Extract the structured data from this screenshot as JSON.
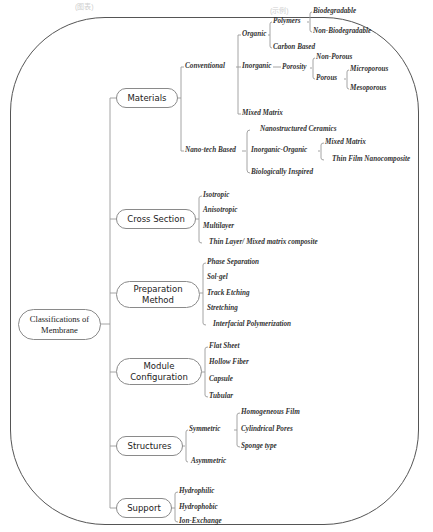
{
  "header_faint": [
    "(图表)",
    "(示例)"
  ],
  "root": {
    "label": "Classifications of Membrane",
    "line1": "Classifications of",
    "line2": "Membrane"
  },
  "categories": {
    "materials": {
      "label": "Materials",
      "conventional": {
        "label": "Conventional",
        "organic": {
          "label": "Organic",
          "polymers": {
            "label": "Polymers",
            "children": [
              "Biodegradable",
              "Non-Biodegradable"
            ]
          },
          "carbon_based": "Carbon Based"
        },
        "inorganic": {
          "label": "Inorganic",
          "porosity": {
            "label": "Porosity",
            "non_porous": "Non-Porous",
            "porous": {
              "label": "Porous",
              "children": [
                "Microporous",
                "Mesoporous"
              ]
            }
          }
        },
        "mixed_matrix": "Mixed Matrix"
      },
      "nanotech": {
        "label": "Nano-tech Based",
        "nanostructured_ceramics": "Nanostructured Ceramics",
        "inorganic_organic": {
          "label": "Inorganic-Organic",
          "children": [
            "Mixed Matrix",
            "Thin Film Nanocomposite"
          ]
        },
        "biologically_inspired": "Biologically Inspired"
      }
    },
    "cross_section": {
      "label": "Cross Section",
      "children": [
        "Isotropic",
        "Anisotropic",
        "Multilayer",
        "Thin Layer/ Mixed matrix composite"
      ]
    },
    "preparation_method": {
      "label": "Preparation Method",
      "line1": "Preparation",
      "line2": "Method",
      "children": [
        "Phase Separation",
        "Sol-gel",
        "Track Etching",
        "Stretching",
        "Interfacial Polymerization"
      ]
    },
    "module_configuration": {
      "label": "Module Configuration",
      "line1": "Module",
      "line2": "Configuration",
      "children": [
        "Flat Sheet",
        "Hollow Fiber",
        "Capsule",
        "Tubular"
      ]
    },
    "structures": {
      "label": "Structures",
      "symmetric": {
        "label": "Symmetric",
        "children": [
          "Homogeneous Film",
          "Cylindrical Pores",
          "Sponge type"
        ]
      },
      "asymmetric": "Asymmetric"
    },
    "support": {
      "label": "Support",
      "children": [
        "Hydrophilic",
        "Hydrophobic",
        "Ion-Exchange"
      ]
    }
  },
  "colors": {
    "line": "#9a9a9a",
    "frame": "#555555",
    "text": "#333333"
  }
}
